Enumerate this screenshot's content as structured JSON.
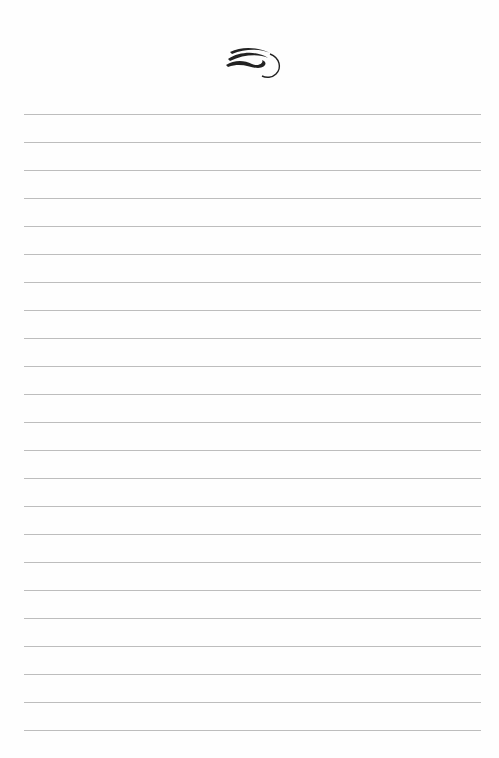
{
  "page": {
    "type": "lined-notepaper",
    "background_color": "#fefefe",
    "line_color": "#bdbdbd",
    "line_count": 23,
    "first_line_y": 114,
    "line_spacing": 28,
    "line_left": 24,
    "line_right": 481
  },
  "header": {
    "ornament": "flourish-icon"
  }
}
